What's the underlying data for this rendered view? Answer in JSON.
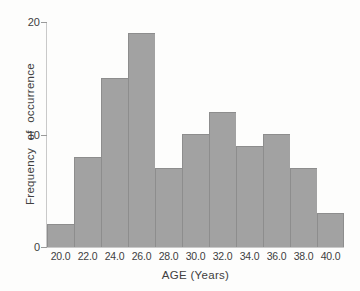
{
  "figure": {
    "background_color": "#fdfdfc",
    "text_color": "#404040",
    "bar_fill_color": "#a2a2a2",
    "bar_border_color": "#8d8d8d",
    "axis_line_color": "#c9c9c9",
    "tick_mark_color": "#9a9a9a"
  },
  "chart_data": {
    "type": "bar",
    "subtype": "histogram",
    "title": "",
    "xlabel": "AGE (Years)",
    "ylabel": "Frequency of occurrence",
    "categories": [
      "20.0",
      "22.0",
      "24.0",
      "26.0",
      "28.0",
      "30.0",
      "32.0",
      "34.0",
      "36.0",
      "38.0",
      "40.0"
    ],
    "values": [
      2,
      8,
      15,
      19,
      7,
      10,
      12,
      9,
      10,
      7,
      3
    ],
    "ylim": [
      0,
      20
    ],
    "yticks": [
      0,
      10,
      20
    ],
    "grid": "off",
    "legend": "none"
  }
}
